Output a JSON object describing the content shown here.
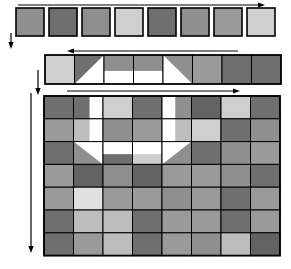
{
  "figure": {
    "background": "#ffffff",
    "stroke_color": "#000000",
    "palette": {
      "dark": "#6f6f6f",
      "darker": "#636363",
      "mid": "#8f8f8f",
      "mid_light": "#9a9a9a",
      "light": "#bdbdbd",
      "lighter": "#cfcfcf",
      "pale": "#e0e0e0",
      "white": "#ffffff"
    }
  },
  "arrows": {
    "top_horizontal": {
      "name": "top-right-arrow",
      "direction": "right",
      "x1": 18,
      "y1": 5,
      "x2": 265,
      "y2": 5
    },
    "top_vertical": {
      "name": "top-down-arrow",
      "direction": "down",
      "x1": 11,
      "y1": 33,
      "x2": 11,
      "y2": 49
    },
    "strip_horizontal": {
      "name": "strip-left-arrow",
      "direction": "left",
      "x1": 238,
      "y1": 51,
      "x2": 67,
      "y2": 51
    },
    "strip_vertical": {
      "name": "strip-down-arrow",
      "direction": "down",
      "x1": 38,
      "y1": 70,
      "x2": 38,
      "y2": 95
    },
    "grid_horizontal": {
      "name": "grid-right-arrow",
      "direction": "right",
      "x1": 67,
      "y1": 91,
      "x2": 240,
      "y2": 91
    },
    "grid_vertical": {
      "name": "grid-down-arrow",
      "direction": "down",
      "x1": 31,
      "y1": 93,
      "x2": 31,
      "y2": 253
    }
  },
  "top_row": {
    "name": "top-square-row",
    "count": 8,
    "x0": 16,
    "y": 8,
    "size": 28,
    "gap": 33,
    "colors": [
      "#8f8f8f",
      "#6f6f6f",
      "#8f8f8f",
      "#cfcfcf",
      "#6f6f6f",
      "#8f8f8f",
      "#9a9a9a",
      "#cfcfcf"
    ]
  },
  "strip_row": {
    "name": "strip-cell-row",
    "count": 8,
    "x0": 45,
    "y": 55,
    "cell_w": 29.5,
    "cell_h": 29,
    "cells": [
      {
        "type": "solid",
        "fill": "#cfcfcf"
      },
      {
        "type": "diag_tl",
        "fill": "#6f6f6f",
        "fill2": "#ffffff"
      },
      {
        "type": "split_h",
        "fill": "#8f8f8f",
        "fill2": "#ffffff"
      },
      {
        "type": "split_h",
        "fill": "#8f8f8f",
        "fill2": "#ffffff"
      },
      {
        "type": "diag_tr",
        "fill": "#8f8f8f",
        "fill2": "#ffffff"
      },
      {
        "type": "solid",
        "fill": "#9a9a9a"
      },
      {
        "type": "solid",
        "fill": "#6f6f6f"
      },
      {
        "type": "solid",
        "fill": "#6f6f6f"
      }
    ]
  },
  "main_grid": {
    "name": "main-pixel-grid",
    "cols": 8,
    "rows": 7,
    "x0": 44,
    "y0": 96,
    "cell_w": 29.5,
    "cell_h": 22.8,
    "rows_data": [
      [
        {
          "type": "solid",
          "fill": "#6f6f6f"
        },
        {
          "type": "split_v_right_white",
          "fill": "#6f6f6f",
          "fill2": "#ffffff"
        },
        {
          "type": "solid",
          "fill": "#cfcfcf"
        },
        {
          "type": "solid",
          "fill": "#6f6f6f"
        },
        {
          "type": "split_v_left_white",
          "fill": "#ffffff",
          "fill2": "#8f8f8f"
        },
        {
          "type": "solid",
          "fill": "#636363"
        },
        {
          "type": "solid",
          "fill": "#cfcfcf"
        },
        {
          "type": "solid",
          "fill": "#6f6f6f"
        }
      ],
      [
        {
          "type": "solid",
          "fill": "#9a9a9a"
        },
        {
          "type": "split_v_right_white",
          "fill": "#bdbdbd",
          "fill2": "#ffffff"
        },
        {
          "type": "solid",
          "fill": "#8f8f8f"
        },
        {
          "type": "solid",
          "fill": "#9a9a9a"
        },
        {
          "type": "split_v_left_white",
          "fill": "#ffffff",
          "fill2": "#bdbdbd"
        },
        {
          "type": "solid",
          "fill": "#cfcfcf"
        },
        {
          "type": "solid",
          "fill": "#6f6f6f"
        },
        {
          "type": "solid",
          "fill": "#8f8f8f"
        }
      ],
      [
        {
          "type": "solid",
          "fill": "#6f6f6f"
        },
        {
          "type": "diag_tr_white",
          "fill": "#8f8f8f",
          "fill2": "#ffffff"
        },
        {
          "type": "split_h_top_white",
          "fill": "#ffffff",
          "fill2": "#6f6f6f"
        },
        {
          "type": "split_h_top_white",
          "fill": "#ffffff",
          "fill2": "#cfcfcf"
        },
        {
          "type": "diag_tl_white",
          "fill": "#ffffff",
          "fill2": "#8f8f8f"
        },
        {
          "type": "solid",
          "fill": "#6f6f6f"
        },
        {
          "type": "solid",
          "fill": "#8f8f8f"
        },
        {
          "type": "solid",
          "fill": "#9a9a9a"
        }
      ],
      [
        {
          "type": "solid",
          "fill": "#9a9a9a"
        },
        {
          "type": "solid",
          "fill": "#636363"
        },
        {
          "type": "solid",
          "fill": "#8f8f8f"
        },
        {
          "type": "solid",
          "fill": "#636363"
        },
        {
          "type": "solid",
          "fill": "#9a9a9a"
        },
        {
          "type": "solid",
          "fill": "#9a9a9a"
        },
        {
          "type": "solid",
          "fill": "#8f8f8f"
        },
        {
          "type": "solid",
          "fill": "#6f6f6f"
        }
      ],
      [
        {
          "type": "solid",
          "fill": "#9a9a9a"
        },
        {
          "type": "solid",
          "fill": "#e0e0e0"
        },
        {
          "type": "solid",
          "fill": "#9a9a9a"
        },
        {
          "type": "solid",
          "fill": "#9a9a9a"
        },
        {
          "type": "solid",
          "fill": "#8f8f8f"
        },
        {
          "type": "solid",
          "fill": "#9a9a9a"
        },
        {
          "type": "solid",
          "fill": "#6f6f6f"
        },
        {
          "type": "solid",
          "fill": "#9a9a9a"
        }
      ],
      [
        {
          "type": "solid",
          "fill": "#6f6f6f"
        },
        {
          "type": "solid",
          "fill": "#bdbdbd"
        },
        {
          "type": "solid",
          "fill": "#bdbdbd"
        },
        {
          "type": "solid",
          "fill": "#6f6f6f"
        },
        {
          "type": "solid",
          "fill": "#9a9a9a"
        },
        {
          "type": "solid",
          "fill": "#9a9a9a"
        },
        {
          "type": "solid",
          "fill": "#6f6f6f"
        },
        {
          "type": "solid",
          "fill": "#9a9a9a"
        }
      ],
      [
        {
          "type": "solid",
          "fill": "#6f6f6f"
        },
        {
          "type": "solid",
          "fill": "#9a9a9a"
        },
        {
          "type": "solid",
          "fill": "#bdbdbd"
        },
        {
          "type": "solid",
          "fill": "#6f6f6f"
        },
        {
          "type": "solid",
          "fill": "#9a9a9a"
        },
        {
          "type": "solid",
          "fill": "#8f8f8f"
        },
        {
          "type": "solid",
          "fill": "#bdbdbd"
        },
        {
          "type": "solid",
          "fill": "#636363"
        }
      ]
    ]
  }
}
